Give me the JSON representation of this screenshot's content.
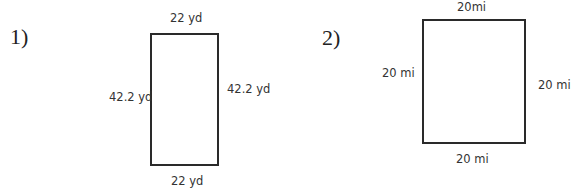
{
  "problems": [
    {
      "number": "1)",
      "shape": "rectangle",
      "labels": {
        "top": "22 yd",
        "bottom": "22 yd",
        "left": "42.2 yd",
        "right": "42.2 yd"
      }
    },
    {
      "number": "2)",
      "shape": "square",
      "labels": {
        "top": "20mi",
        "bottom": "20 mi",
        "left": "20 mi",
        "right": "20 mi"
      }
    }
  ]
}
